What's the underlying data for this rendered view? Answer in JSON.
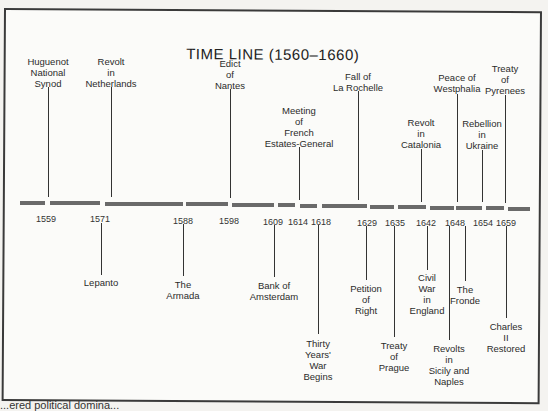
{
  "title": "TIME LINE (1560–1660)",
  "timeline": {
    "segments": [
      {
        "x": 20,
        "w": 25
      },
      {
        "x": 50,
        "w": 50
      },
      {
        "x": 105,
        "w": 78
      },
      {
        "x": 186,
        "w": 42
      },
      {
        "x": 232,
        "w": 42
      },
      {
        "x": 278,
        "w": 17
      },
      {
        "x": 300,
        "w": 17
      },
      {
        "x": 322,
        "w": 45
      },
      {
        "x": 370,
        "w": 24
      },
      {
        "x": 398,
        "w": 28
      },
      {
        "x": 430,
        "w": 24
      },
      {
        "x": 456,
        "w": 26
      },
      {
        "x": 486,
        "w": 18
      },
      {
        "x": 508,
        "w": 22
      }
    ],
    "years": [
      {
        "label": "1559",
        "x": 46,
        "y": 214
      },
      {
        "label": "1571",
        "x": 100,
        "y": 214
      },
      {
        "label": "1588",
        "x": 183,
        "y": 216
      },
      {
        "label": "1598",
        "x": 229,
        "y": 216
      },
      {
        "label": "1609",
        "x": 273,
        "y": 217
      },
      {
        "label": "1614",
        "x": 298,
        "y": 217
      },
      {
        "label": "1618",
        "x": 321,
        "y": 217
      },
      {
        "label": "1629",
        "x": 367,
        "y": 218
      },
      {
        "label": "1635",
        "x": 395,
        "y": 218
      },
      {
        "label": "1642",
        "x": 426,
        "y": 218
      },
      {
        "label": "1648",
        "x": 455,
        "y": 218
      },
      {
        "label": "1654",
        "x": 483,
        "y": 218
      },
      {
        "label": "1659",
        "x": 506,
        "y": 218
      }
    ],
    "events_above": [
      {
        "year": "1559",
        "text": "Huguenot\nNational\nSynod",
        "x": 48,
        "label_y": 56,
        "line_top": 87,
        "line_bottom": 197
      },
      {
        "year": "1571",
        "text": "Revolt\nin\nNetherlands",
        "x": 111,
        "label_y": 56,
        "line_top": 87,
        "line_bottom": 197
      },
      {
        "year": "1598",
        "text": "Edict\nof\nNantes",
        "x": 230,
        "label_y": 58,
        "line_top": 89,
        "line_bottom": 198
      },
      {
        "year": "1614",
        "text": "Meeting\nof\nFrench\nEstates-General",
        "x": 299,
        "label_y": 105,
        "line_top": 147,
        "line_bottom": 200
      },
      {
        "year": "1629",
        "text": "Fall of\nLa Rochelle",
        "x": 358,
        "label_y": 71,
        "line_top": 91,
        "line_bottom": 200
      },
      {
        "year": "1642",
        "text": "Revolt\nin\nCatalonia",
        "x": 421,
        "label_y": 117,
        "line_top": 149,
        "line_bottom": 202
      },
      {
        "year": "1648",
        "text": "Peace of\nWestphalia",
        "x": 457,
        "label_y": 72,
        "line_top": 94,
        "line_bottom": 202
      },
      {
        "year": "1654",
        "text": "Rebellion\nin\nUkraine",
        "x": 482,
        "label_y": 118,
        "line_top": 150,
        "line_bottom": 202
      },
      {
        "year": "1659",
        "text": "Treaty\nof\nPyrenees",
        "x": 505,
        "label_y": 63,
        "line_top": 95,
        "line_bottom": 203
      }
    ],
    "events_below": [
      {
        "year": "1571",
        "text": "Lepanto",
        "x": 101,
        "line_top": 223,
        "line_bottom": 275,
        "label_y": 277
      },
      {
        "year": "1588",
        "text": "The\nArmada",
        "x": 183,
        "line_top": 224,
        "line_bottom": 276,
        "label_y": 279
      },
      {
        "year": "1609",
        "text": "Bank of\nAmsterdam",
        "x": 274,
        "line_top": 225,
        "line_bottom": 277,
        "label_y": 280
      },
      {
        "year": "1618",
        "text": "Thirty\nYears'\nWar\nBegins",
        "x": 318,
        "line_top": 225,
        "line_bottom": 334,
        "label_y": 338
      },
      {
        "year": "1629",
        "text": "Petition\nof\nRight",
        "x": 366,
        "line_top": 226,
        "line_bottom": 280,
        "label_y": 283
      },
      {
        "year": "1635",
        "text": "Treaty\nof\nPrague",
        "x": 394,
        "line_top": 226,
        "line_bottom": 337,
        "label_y": 340
      },
      {
        "year": "1642",
        "text": "Civil\nWar\nin\nEngland",
        "x": 427,
        "line_top": 226,
        "line_bottom": 270,
        "label_y": 272
      },
      {
        "year": "1648",
        "text": "Revolts\nin\nSicily and\nNaples",
        "x": 449,
        "line_top": 226,
        "line_bottom": 340,
        "label_y": 343
      },
      {
        "year": "1648",
        "text": "The\nFronde",
        "x": 465,
        "line_top": 226,
        "line_bottom": 281,
        "label_y": 284
      },
      {
        "year": "1659",
        "text": "Charles\nII\nRestored",
        "x": 506,
        "line_top": 226,
        "line_bottom": 318,
        "label_y": 321
      }
    ]
  },
  "footer_text": "...ered political domina..."
}
